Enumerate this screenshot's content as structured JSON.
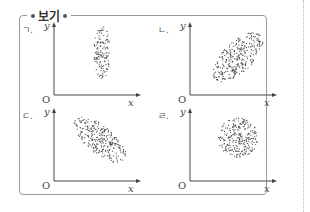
{
  "box": {
    "title": "보기"
  },
  "panels": [
    {
      "id": "a",
      "label": "ㄱ.",
      "y_axis": "y",
      "x_axis": "x",
      "origin": "O",
      "pattern": "vertical narrow ellipse (no correlation, small x spread)"
    },
    {
      "id": "b",
      "label": "ㄴ.",
      "y_axis": "y",
      "x_axis": "x",
      "origin": "O",
      "pattern": "ellipse tilted upward (positive correlation)"
    },
    {
      "id": "c",
      "label": "ㄷ.",
      "y_axis": "y",
      "x_axis": "x",
      "origin": "O",
      "pattern": "ellipse tilted downward (negative correlation)"
    },
    {
      "id": "d",
      "label": "ㄹ.",
      "y_axis": "y",
      "x_axis": "x",
      "origin": "O",
      "pattern": "circle (no correlation)"
    }
  ],
  "colors": {
    "border": "#9a9a9a",
    "dots": "#444444",
    "axis": "#444444"
  }
}
